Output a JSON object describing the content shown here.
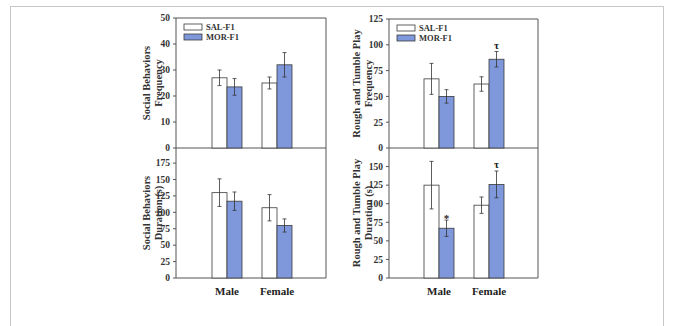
{
  "colors": {
    "sal": "#ffffff",
    "mor": "#7f98dc",
    "outline": "#3a3a3a",
    "axis": "#555555",
    "frame": "#c8c8c8"
  },
  "legend": [
    "SAL-F1",
    "MOR-F1"
  ],
  "categories": [
    "Male",
    "Female"
  ],
  "chart_data": [
    {
      "type": "bar",
      "title": "",
      "ylabel": "Social Behaviors Frequency",
      "xlabel": "",
      "categories": [
        "Male",
        "Female"
      ],
      "ylim": [
        0,
        50
      ],
      "yticks": [
        0,
        10,
        20,
        30,
        40,
        50
      ],
      "grid": false,
      "legend_position": "upper-left",
      "series": [
        {
          "name": "SAL-F1",
          "values": [
            27,
            25
          ],
          "errors": [
            3,
            2.3
          ]
        },
        {
          "name": "MOR-F1",
          "values": [
            23.5,
            32
          ],
          "errors": [
            3.2,
            4.7
          ]
        }
      ],
      "annotations": []
    },
    {
      "type": "bar",
      "title": "",
      "ylabel": "Rough and Tumble Play Frequency",
      "xlabel": "",
      "categories": [
        "Male",
        "Female"
      ],
      "ylim": [
        0,
        125
      ],
      "yticks": [
        0,
        25,
        50,
        75,
        100,
        125
      ],
      "grid": false,
      "legend_position": "upper-left",
      "series": [
        {
          "name": "SAL-F1",
          "values": [
            67,
            62
          ],
          "errors": [
            15,
            7
          ]
        },
        {
          "name": "MOR-F1",
          "values": [
            50,
            86
          ],
          "errors": [
            6.5,
            7.5
          ]
        }
      ],
      "annotations": [
        {
          "series": "MOR-F1",
          "category": "Female",
          "text": "τ"
        }
      ]
    },
    {
      "type": "bar",
      "title": "",
      "ylabel": "Social Behaviors Duration (s)",
      "xlabel": "",
      "categories": [
        "Male",
        "Female"
      ],
      "ylim": [
        0,
        198
      ],
      "yticks": [
        0,
        25,
        50,
        75,
        100,
        125,
        150,
        175
      ],
      "grid": false,
      "series": [
        {
          "name": "SAL-F1",
          "values": [
            130,
            107
          ],
          "errors": [
            21,
            20
          ]
        },
        {
          "name": "MOR-F1",
          "values": [
            117,
            80
          ],
          "errors": [
            14,
            10
          ]
        }
      ],
      "annotations": []
    },
    {
      "type": "bar",
      "title": "",
      "ylabel": "Rough and Tumble Play Duration (s)",
      "xlabel": "",
      "categories": [
        "Male",
        "Female"
      ],
      "ylim": [
        0,
        175
      ],
      "yticks": [
        0,
        25,
        50,
        75,
        100,
        125,
        150
      ],
      "grid": false,
      "series": [
        {
          "name": "SAL-F1",
          "values": [
            125,
            98
          ],
          "errors": [
            32,
            11
          ]
        },
        {
          "name": "MOR-F1",
          "values": [
            67,
            126
          ],
          "errors": [
            11,
            18
          ]
        }
      ],
      "annotations": [
        {
          "series": "MOR-F1",
          "category": "Male",
          "text": "*"
        },
        {
          "series": "MOR-F1",
          "category": "Female",
          "text": "τ"
        }
      ]
    }
  ]
}
